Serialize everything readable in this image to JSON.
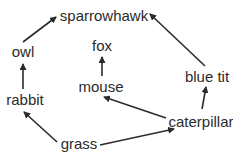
{
  "diagram": {
    "type": "food-web",
    "nodes": {
      "sparrowhawk": {
        "label": "sparrowhawk",
        "x": 104,
        "y": 21
      },
      "owl": {
        "label": "owl",
        "x": 23,
        "y": 57
      },
      "fox": {
        "label": "fox",
        "x": 102,
        "y": 51
      },
      "blue_tit": {
        "label": "blue tit",
        "x": 207,
        "y": 82
      },
      "mouse": {
        "label": "mouse",
        "x": 101,
        "y": 92
      },
      "rabbit": {
        "label": "rabbit",
        "x": 25,
        "y": 105
      },
      "caterpillar": {
        "label": "caterpillar",
        "x": 201,
        "y": 127
      },
      "grass": {
        "label": "grass",
        "x": 79,
        "y": 149
      }
    },
    "edges": [
      {
        "from": "owl",
        "to": "sparrowhawk",
        "x1": 23,
        "y1": 42,
        "x2": 56,
        "y2": 17
      },
      {
        "from": "blue_tit",
        "to": "sparrowhawk",
        "x1": 205,
        "y1": 66,
        "x2": 150,
        "y2": 14
      },
      {
        "from": "rabbit",
        "to": "owl",
        "x1": 23,
        "y1": 89,
        "x2": 23,
        "y2": 64
      },
      {
        "from": "mouse",
        "to": "fox",
        "x1": 102,
        "y1": 76,
        "x2": 102,
        "y2": 57
      },
      {
        "from": "caterpillar",
        "to": "blue_tit",
        "x1": 202,
        "y1": 109,
        "x2": 206,
        "y2": 87
      },
      {
        "from": "caterpillar",
        "to": "mouse",
        "x1": 166,
        "y1": 118,
        "x2": 104,
        "y2": 97
      },
      {
        "from": "grass",
        "to": "rabbit",
        "x1": 57,
        "y1": 142,
        "x2": 24,
        "y2": 112
      },
      {
        "from": "grass",
        "to": "caterpillar",
        "x1": 100,
        "y1": 145,
        "x2": 174,
        "y2": 129
      }
    ]
  }
}
